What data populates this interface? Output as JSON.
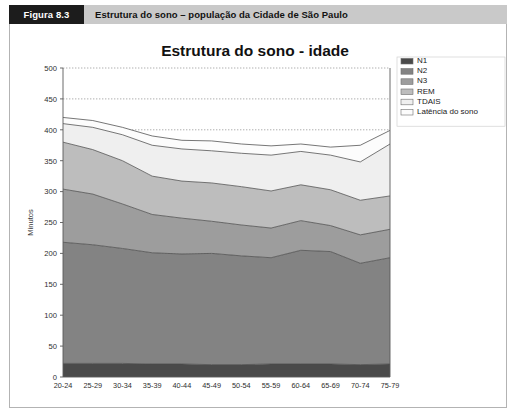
{
  "figure": {
    "tag": "Figura 8.3",
    "caption": "Estrutura do sono – população da Cidade de São Paulo"
  },
  "chart_data": {
    "type": "area",
    "stacked": true,
    "title": "Estrutura do sono - idade",
    "xlabel": "",
    "ylabel": "Minutos",
    "ylim": [
      0,
      500
    ],
    "yticks": [
      0,
      50,
      100,
      150,
      200,
      250,
      300,
      350,
      400,
      450,
      500
    ],
    "grid": true,
    "legend_position": "top-right",
    "categories": [
      "20-24",
      "25-29",
      "30-34",
      "35-39",
      "40-44",
      "45-49",
      "50-54",
      "55-59",
      "60-64",
      "65-69",
      "70-74",
      "75-79"
    ],
    "series": [
      {
        "name": "N1",
        "color": "#4a4a4a",
        "values": [
          22,
          22,
          22,
          21,
          21,
          20,
          20,
          21,
          21,
          21,
          20,
          21
        ]
      },
      {
        "name": "N2",
        "color": "#838383",
        "values": [
          196,
          192,
          186,
          180,
          178,
          180,
          176,
          172,
          184,
          182,
          164,
          172
        ]
      },
      {
        "name": "N3",
        "color": "#9d9d9d",
        "values": [
          86,
          82,
          72,
          62,
          58,
          52,
          50,
          48,
          48,
          42,
          46,
          46
        ]
      },
      {
        "name": "REM",
        "color": "#bdbdbd",
        "values": [
          76,
          72,
          70,
          62,
          60,
          62,
          62,
          60,
          58,
          58,
          56,
          54
        ]
      },
      {
        "name": "TDAIS",
        "color": "#efefef",
        "values": [
          30,
          36,
          42,
          50,
          52,
          52,
          54,
          58,
          54,
          56,
          62,
          84
        ]
      },
      {
        "name": "Latência do sono",
        "color": "#fcfcfc",
        "values": [
          10,
          11,
          12,
          15,
          14,
          16,
          15,
          15,
          12,
          13,
          27,
          22
        ]
      }
    ],
    "totals": [
      420,
      415,
      404,
      390,
      383,
      382,
      377,
      374,
      377,
      372,
      375,
      399
    ]
  },
  "legend": {
    "items": [
      {
        "label": "N1",
        "swatch": "#4a4a4a"
      },
      {
        "label": "N2",
        "swatch": "#838383"
      },
      {
        "label": "N3",
        "swatch": "#9d9d9d"
      },
      {
        "label": "REM",
        "swatch": "#bdbdbd"
      },
      {
        "label": "TDAIS",
        "swatch": "#efefef"
      },
      {
        "label": "Latência do sono",
        "swatch": "#fcfcfc"
      }
    ]
  }
}
